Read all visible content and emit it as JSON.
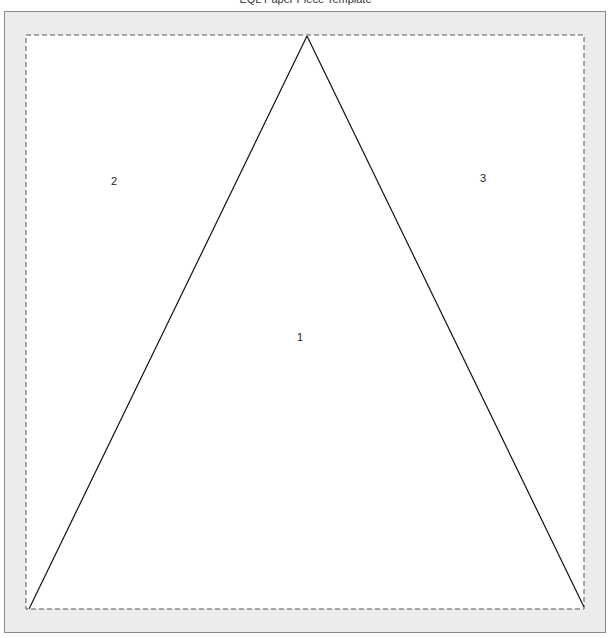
{
  "title": "EQL Paper Piece Template",
  "colors": {
    "sheet_background": "#ececec",
    "sheet_border": "#8a8a8a",
    "piece_area": "#ffffff",
    "dashed_line": "#555555",
    "seam_line": "#111111"
  },
  "template": {
    "outer_seam_allowance": "dashed",
    "pieces": [
      {
        "label": "1",
        "shape": "triangle (center)"
      },
      {
        "label": "2",
        "shape": "left corner region"
      },
      {
        "label": "3",
        "shape": "right corner region"
      }
    ]
  },
  "labels": {
    "piece1": "1",
    "piece2": "2",
    "piece3": "3"
  }
}
